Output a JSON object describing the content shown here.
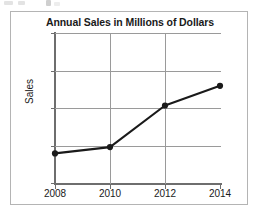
{
  "figure": {
    "title": "Annual Sales in Millions of Dollars"
  },
  "chart_data": {
    "type": "line",
    "title": "Annual Sales in Millions of Dollars",
    "xlabel": "",
    "ylabel": "Sales",
    "categories": [
      "2008",
      "2010",
      "2012",
      "2014"
    ],
    "x": [
      2008,
      2010,
      2012,
      2014
    ],
    "values": [
      24,
      27,
      35.5,
      39.5
    ],
    "series": [
      {
        "name": "Sales",
        "values": [
          24,
          27,
          35.5,
          39.5
        ]
      }
    ],
    "y_tick_labels": [
      "50",
      "42.5",
      "35",
      "27.5",
      "10"
    ],
    "y_tick_values": [
      50,
      42.5,
      35,
      27.5,
      10
    ],
    "x_tick_labels": [
      "2008",
      "2010",
      "2012",
      "2014"
    ],
    "ylim": [
      10,
      50
    ],
    "xlim": [
      2008,
      2014
    ],
    "grid": true,
    "legend": false,
    "marker": "filled-circle",
    "line_color": "#1a1a1a",
    "grid_color": "#9a9a9a",
    "axis_color": "#6e6e6e"
  }
}
